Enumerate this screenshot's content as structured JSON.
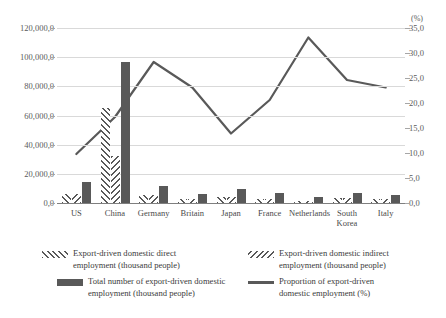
{
  "chart_data": {
    "type": "bar",
    "title": "",
    "subtitle": "",
    "xlabel": "",
    "ylabel": "",
    "y2label": "(%)",
    "grid": true,
    "legend_position": "bottom",
    "categories": [
      "US",
      "China",
      "Germany",
      "Britain",
      "Japan",
      "France",
      "Netherlands",
      "South Korea",
      "Italy"
    ],
    "ylim": [
      0,
      120000
    ],
    "y_ticks": [
      0,
      20000,
      40000,
      60000,
      80000,
      100000,
      120000
    ],
    "y_tick_labels": [
      "0,0",
      "20,000,0",
      "40,000,0",
      "60,000,0",
      "80,000,0",
      "100,000,0",
      "120,000,0"
    ],
    "y2lim": [
      0,
      35
    ],
    "y2_ticks": [
      0,
      5,
      10,
      15,
      20,
      25,
      30,
      35
    ],
    "y2_tick_labels": [
      "0,0",
      "5,0",
      "10,0",
      "15,0",
      "20,0",
      "25,0",
      "30,0",
      "35,0"
    ],
    "series": [
      {
        "name": "Export-driven domestic direct employment (thousand people)",
        "type": "bar",
        "axis": "left",
        "pattern": "forward-hatch",
        "values": [
          6200,
          65000,
          5200,
          2600,
          4000,
          2600,
          1500,
          3100,
          2600
        ]
      },
      {
        "name": "Export-driven domestic indirect employment (thousand people)",
        "type": "bar",
        "axis": "left",
        "pattern": "backward-hatch",
        "values": [
          6300,
          32000,
          5300,
          2700,
          4100,
          2700,
          1600,
          3200,
          2700
        ]
      },
      {
        "name": "Total number of export-driven domestic employment (thousand people)",
        "type": "bar",
        "axis": "left",
        "pattern": "solid",
        "values": [
          14500,
          97000,
          11800,
          6400,
          9300,
          6700,
          4200,
          6900,
          5800
        ]
      },
      {
        "name": "Proportion of export-driven domestic employment (%)",
        "type": "line",
        "axis": "right",
        "pattern": "line",
        "values": [
          9.8,
          17.2,
          28.2,
          23.1,
          13.9,
          20.6,
          33.1,
          24.6,
          23.1
        ]
      }
    ]
  },
  "legend": {
    "items": [
      {
        "label": "Export-driven domestic direct\nemployment (thousand people)",
        "marker": "forward-hatch-swatch"
      },
      {
        "label": "Export-driven domestic indirect\nemployment (thousand people)",
        "marker": "backward-hatch-swatch"
      },
      {
        "label": "Total number of export-driven domestic\nemployment (thousand people)",
        "marker": "solid-swatch"
      },
      {
        "label": "Proportion of export-driven\ndomestic employment (%)",
        "marker": "line-swatch"
      }
    ]
  },
  "colors": {
    "bar_fill": "#595959",
    "line": "#595959",
    "grid": "#d9d9d9",
    "axis": "#7f7f7f",
    "text": "#3b3b3b"
  }
}
